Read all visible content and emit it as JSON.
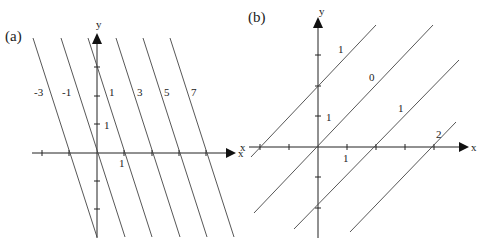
{
  "panel_a": {
    "label": "(a)",
    "x_axis_label": "x",
    "y_axis_label": "y",
    "x_unit_label": "1",
    "y_unit_label": "1",
    "level_labels": [
      "-3",
      "-1",
      "1",
      "3",
      "5",
      "7"
    ]
  },
  "panel_b": {
    "label": "(b)",
    "x_axis_label": "x",
    "x_axis_neg_label": "x",
    "y_axis_label": "y",
    "x_unit_label": "1",
    "y_unit_label": "1",
    "level_labels": [
      "1",
      "0",
      "1",
      "2"
    ]
  },
  "colors": {
    "line": "#333333",
    "axis": "#222222",
    "background": "#ffffff"
  }
}
